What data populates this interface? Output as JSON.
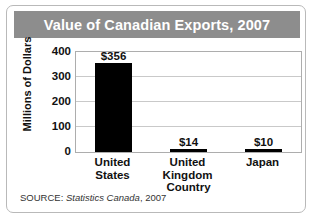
{
  "figure": {
    "title": "Value of Canadian Exports, 2007",
    "source": {
      "label": "SOURCE:",
      "publication": "Statistics Canada",
      "year": ", 2007"
    }
  },
  "chart_data": {
    "type": "bar",
    "title": "Value of Canadian Exports, 2007",
    "xlabel": "Country",
    "ylabel": "Millions of Dollars",
    "categories": [
      "United States",
      "United Kingdom",
      "Japan"
    ],
    "category_lines": [
      [
        "United",
        "States"
      ],
      [
        "United",
        "Kingdom"
      ],
      [
        "Japan"
      ]
    ],
    "values": [
      356,
      14,
      10
    ],
    "value_labels": [
      "$356",
      "$14",
      "$10"
    ],
    "ylim": [
      0,
      400
    ],
    "yticks": [
      0,
      100,
      200,
      300,
      400
    ],
    "ytick_labels": [
      "0",
      "100",
      "200",
      "300",
      "400"
    ],
    "grid": true,
    "legend": false,
    "bar_color": "#000000",
    "plot_background": "#ffffff",
    "title_bar_color": "#8d8d8d",
    "title_text_color": "#ffffff",
    "gridline_color": "#c9c9c9"
  }
}
